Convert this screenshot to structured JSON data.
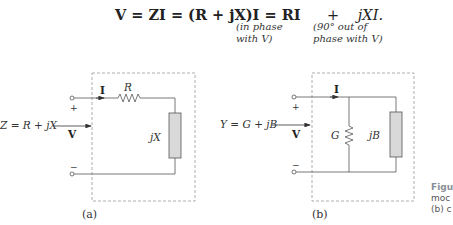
{
  "equation": {
    "text": "V = ZI = (R + jX)I = RI     +    jXI.",
    "lhs": "V = ZI = (R + jX)I = RI",
    "plus": "+",
    "rhs": "jXI.",
    "note_left": [
      "(in phase",
      "with V)"
    ],
    "note_right": [
      "(90° out of",
      "phase with V)"
    ]
  },
  "circuit_a": {
    "caption": "(a)",
    "input_label": "Z = R + jX",
    "current_label": "I",
    "voltage_label": "V",
    "plus_sign": "+",
    "minus_sign": "−",
    "resistor_label": "R",
    "reactance_label": "jX"
  },
  "circuit_b": {
    "caption": "(b)",
    "input_label": "Y = G + jB",
    "current_label": "I",
    "voltage_label": "V",
    "plus_sign": "+",
    "minus_sign": "−",
    "conductance_label": "G",
    "susceptance_label": "jB"
  },
  "figure_caption": {
    "lines": [
      "Figu",
      "moc",
      "(b) c"
    ]
  },
  "colors": {
    "wire": "#555555",
    "dashed_box": "#9a9a9a",
    "element_fill": "#d9d9d9",
    "caption_gray": "#8a8f96"
  }
}
